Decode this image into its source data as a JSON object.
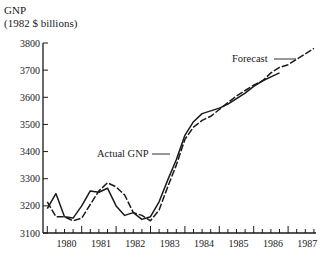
{
  "chart_data": {
    "type": "line",
    "title": "",
    "ylabel_line1": "GNP",
    "ylabel_line2": "(1982 $ billions)",
    "xlabel": "",
    "ylim": [
      3100,
      3800
    ],
    "yticks": [
      3100,
      3200,
      3300,
      3400,
      3500,
      3600,
      3700,
      3800
    ],
    "xticks": [
      "1980",
      "1981",
      "1982",
      "1983",
      "1984",
      "1985",
      "1986",
      "1987"
    ],
    "x_minor_ticks": "quarterly",
    "grid": false,
    "legend": "none (inline annotations)",
    "annotations": [
      {
        "text": "Actual GNP",
        "points_to": "solid series, ~1983 Q3"
      },
      {
        "text": "Forecast",
        "points_to": "second series, ~1986 Q4"
      }
    ],
    "x": [
      "1979Q4",
      "1980Q1",
      "1980Q2",
      "1980Q3",
      "1980Q4",
      "1981Q1",
      "1981Q2",
      "1981Q3",
      "1981Q4",
      "1982Q1",
      "1982Q2",
      "1982Q3",
      "1982Q4",
      "1983Q1",
      "1983Q2",
      "1983Q3",
      "1983Q4",
      "1984Q1",
      "1984Q2",
      "1984Q3",
      "1984Q4",
      "1985Q1",
      "1985Q2",
      "1985Q3",
      "1985Q4",
      "1986Q1",
      "1986Q2",
      "1986Q3",
      "1986Q4",
      "1987Q1",
      "1987Q2",
      "1987Q3"
    ],
    "series": [
      {
        "name": "Actual GNP",
        "values": [
          3190,
          3245,
          3160,
          3155,
          3200,
          3255,
          3250,
          3265,
          3200,
          3165,
          3175,
          3150,
          3160,
          3215,
          3295,
          3370,
          3460,
          3510,
          3540,
          3550,
          3560,
          3575,
          3595,
          3615,
          3640,
          3660,
          3675,
          3690,
          null,
          null,
          null,
          null
        ]
      },
      {
        "name": "Forecast",
        "values": [
          3215,
          3160,
          3160,
          3145,
          3155,
          3205,
          3255,
          3285,
          3270,
          3240,
          3175,
          3165,
          3145,
          3185,
          3270,
          3350,
          3445,
          3490,
          3515,
          3530,
          3555,
          3580,
          3605,
          3625,
          3645,
          3660,
          3690,
          3710,
          3720,
          3740,
          3760,
          3780
        ]
      }
    ]
  },
  "labels": {
    "actual": "Actual GNP",
    "forecast": "Forecast"
  }
}
